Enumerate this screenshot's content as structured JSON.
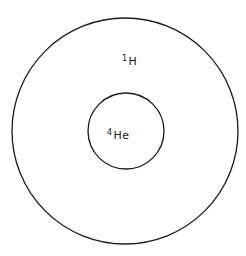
{
  "diagram": {
    "outer_shell": {
      "label_mass": "1",
      "label_element": "H",
      "cx": 125,
      "cy": 131,
      "r": 113
    },
    "inner_core": {
      "label_mass": "4",
      "label_element": "He",
      "cx": 126,
      "cy": 131,
      "r": 38
    },
    "stroke_color": "#1a1a1a",
    "background": "#ffffff"
  }
}
